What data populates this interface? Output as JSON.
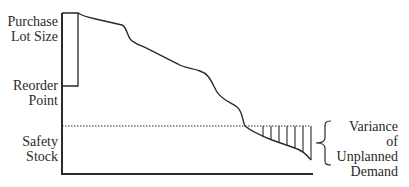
{
  "diagram": {
    "type": "inventory-sawtooth",
    "labels": {
      "purchase_lot_size": [
        "Purchase",
        "Lot Size"
      ],
      "reorder_point": [
        "Reorder",
        "Point"
      ],
      "safety_stock": [
        "Safety",
        "Stock"
      ],
      "variance": [
        "Variance of",
        "Unplanned",
        "Demand"
      ]
    },
    "colors": {
      "line": "#2a2a2a",
      "background": "#ffffff"
    }
  }
}
